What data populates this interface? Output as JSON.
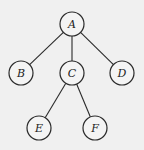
{
  "diagram": {
    "type": "tree",
    "nodes": [
      {
        "id": "A",
        "label": "A",
        "x": 72,
        "y": 24
      },
      {
        "id": "B",
        "label": "B",
        "x": 21,
        "y": 73
      },
      {
        "id": "C",
        "label": "C",
        "x": 72,
        "y": 73
      },
      {
        "id": "D",
        "label": "D",
        "x": 122,
        "y": 73
      },
      {
        "id": "E",
        "label": "E",
        "x": 39,
        "y": 128
      },
      {
        "id": "F",
        "label": "F",
        "x": 95,
        "y": 128
      }
    ],
    "edges": [
      {
        "from": "A",
        "to": "B"
      },
      {
        "from": "A",
        "to": "C"
      },
      {
        "from": "A",
        "to": "D"
      },
      {
        "from": "C",
        "to": "E"
      },
      {
        "from": "C",
        "to": "F"
      }
    ],
    "node_radius": 12,
    "colors": {
      "background": "#f0f0f0",
      "stroke": "#2a2a2a",
      "node_fill": "#f4f4f4"
    }
  }
}
